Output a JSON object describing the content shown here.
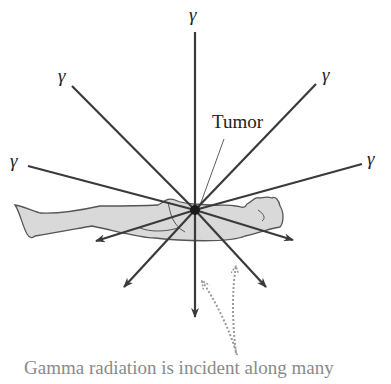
{
  "figure": {
    "gamma_symbol": "γ",
    "tumor_label": "Tumor",
    "caption": "Gamma radiation is incident along many",
    "colors": {
      "beam": "#3a3a3a",
      "body_fill": "#d9d9d9",
      "body_outline": "#555555",
      "tumor": "#1a1a1a",
      "dotted_arrows": "#9a9a9a",
      "caption_text": "#8a8a8a"
    },
    "beams": [
      {
        "from": "top",
        "label": "γ"
      },
      {
        "from": "upper-left",
        "label": "γ"
      },
      {
        "from": "upper-right",
        "label": "γ"
      },
      {
        "from": "left",
        "label": "γ"
      },
      {
        "from": "right",
        "label": "γ"
      }
    ]
  }
}
